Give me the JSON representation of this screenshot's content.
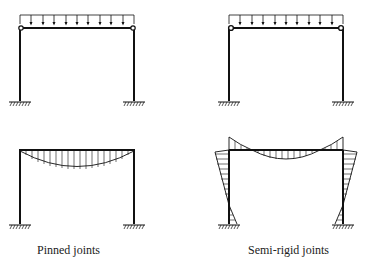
{
  "diagram": {
    "panels": [
      {
        "id": "pinned",
        "label": "Pinned joints"
      },
      {
        "id": "semi_rigid",
        "label": "Semi-rigid joints"
      }
    ],
    "colors": {
      "line": "#111111",
      "background": "#ffffff"
    }
  }
}
